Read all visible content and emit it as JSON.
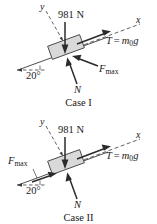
{
  "figure": {
    "background_color": "#ffffff",
    "ink_color": "#2b2b2b",
    "block_fill": "#d9d9d9",
    "block_stroke": "#4a4a4a",
    "incline_angle_deg": 20
  },
  "cases": [
    {
      "id": "case-1",
      "caption": "Case I",
      "labels": {
        "y_axis": "y",
        "x_axis": "x",
        "weight": "981 N",
        "tension_symbol": "T",
        "tension_equals": "=",
        "tension_mass": "m",
        "tension_sub": "0",
        "tension_g": "g",
        "friction": "F",
        "friction_sub": "max",
        "normal": "N",
        "angle": "20°"
      },
      "forces": [
        {
          "name": "weight",
          "label": "981 N",
          "direction": "down",
          "magnitude_n": 981
        },
        {
          "name": "tension",
          "label": "T = m0g",
          "direction": "up-incline"
        },
        {
          "name": "friction",
          "label": "Fmax",
          "direction": "down-incline"
        },
        {
          "name": "normal",
          "label": "N",
          "direction": "perpendicular-out"
        }
      ]
    },
    {
      "id": "case-2",
      "caption": "Case II",
      "labels": {
        "y_axis": "y",
        "x_axis": "x",
        "weight": "981 N",
        "tension_symbol": "T",
        "tension_equals": "=",
        "tension_mass": "m",
        "tension_sub": "0",
        "tension_g": "g",
        "friction": "F",
        "friction_sub": "max",
        "normal": "N",
        "angle": "20°"
      },
      "forces": [
        {
          "name": "weight",
          "label": "981 N",
          "direction": "down",
          "magnitude_n": 981
        },
        {
          "name": "tension",
          "label": "T = m0g",
          "direction": "up-incline"
        },
        {
          "name": "friction",
          "label": "Fmax",
          "direction": "up-incline"
        },
        {
          "name": "normal",
          "label": "N",
          "direction": "perpendicular-out"
        }
      ]
    }
  ]
}
